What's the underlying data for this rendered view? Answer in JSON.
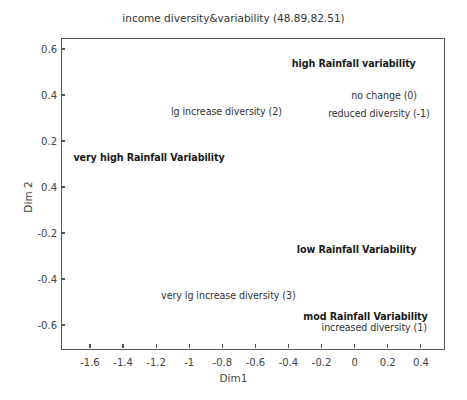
{
  "chart_data": {
    "type": "scatter",
    "title": "income diversity&variability (48.89,82.51)",
    "xlabel": "Dim1",
    "ylabel": "Dim 2",
    "xlim": [
      -1.775,
      0.54
    ],
    "ylim": [
      -0.7,
      0.648
    ],
    "grid": false,
    "legend": null,
    "x_ticks": [
      -1.6,
      -1.4,
      -1.2,
      -1,
      -0.8,
      -0.6,
      -0.4,
      -0.2,
      0,
      0.2,
      0.4
    ],
    "x_tick_labels": [
      "-1.6",
      "-1.4",
      "-1.2",
      "-1",
      "-0.8",
      "-0.6",
      "-0.4",
      "-0.2",
      "0",
      "0.2",
      "0.4"
    ],
    "y_ticks": [
      0.6,
      0.4,
      0.2,
      0,
      -0.2,
      -0.4,
      -0.6
    ],
    "y_tick_labels": [
      "0.6",
      "0.4",
      "0.2",
      "0.4",
      "-0.2",
      "-0.4",
      "-0.6"
    ],
    "points": [
      {
        "label": "high Rainfall variability",
        "x": -0.38,
        "y": 0.54,
        "group": "rainfall"
      },
      {
        "label": "no change (0)",
        "x": -0.02,
        "y": 0.4,
        "group": "diversity"
      },
      {
        "label": "reduced diversity (-1)",
        "x": -0.16,
        "y": 0.32,
        "group": "diversity"
      },
      {
        "label": "lg increase diversity (2)",
        "x": -1.11,
        "y": 0.33,
        "group": "diversity"
      },
      {
        "label": "very high Rainfall Variability",
        "x": -1.7,
        "y": 0.13,
        "group": "rainfall"
      },
      {
        "label": "low Rainfall Variability",
        "x": -0.35,
        "y": -0.27,
        "group": "rainfall"
      },
      {
        "label": "very lg increase diversity (3)",
        "x": -1.17,
        "y": -0.47,
        "group": "diversity"
      },
      {
        "label": "mod Rainfall Variability",
        "x": -0.31,
        "y": -0.56,
        "group": "rainfall"
      },
      {
        "label": "increased diversity (1)",
        "x": -0.2,
        "y": -0.61,
        "group": "diversity"
      }
    ]
  }
}
